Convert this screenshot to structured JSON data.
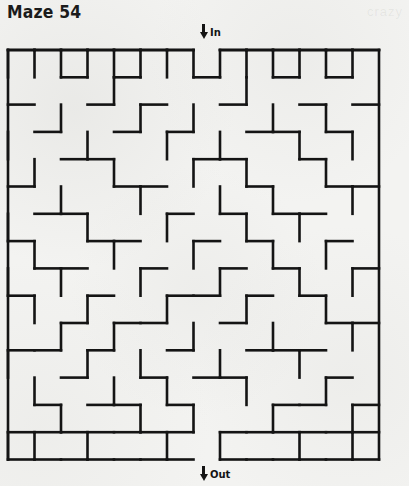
{
  "page": {
    "title": "Maze 54",
    "watermark": "crazy",
    "background_color": "#f3f3f1",
    "wall_color": "#141414"
  },
  "maze": {
    "label_in": "In",
    "label_out": "Out",
    "in_icon": "arrow-down-icon",
    "out_icon": "arrow-down-icon",
    "cols": 14,
    "rows": 15,
    "cell_w": 26.5,
    "cell_h": 27.3,
    "origin_x": 8,
    "origin_y": 50,
    "wall_thickness": 2.6,
    "entrance_col": 7,
    "exit_col": 7,
    "h_walls": [
      "11111110111111",
      "00101001001010",
      "10010100100101",
      "01001010011010",
      "00110001100100",
      "10001100010011",
      "01100010101100",
      "10011001010010",
      "01100100101001",
      "10010011010100",
      "00101100100011",
      "11010010011100",
      "00100101100010",
      "01011010001101",
      "11111110111111"
    ],
    "v_walls": [
      "100100101001001",
      "100010010100101",
      "101001001010010",
      "100100100101001",
      "110010010010100",
      "101001001001010",
      "100100100100101",
      "101010010010010",
      "100101001001001",
      "110010100100100",
      "101001010010010",
      "100100101001001",
      "101010010100100",
      "100101001010011"
    ]
  }
}
